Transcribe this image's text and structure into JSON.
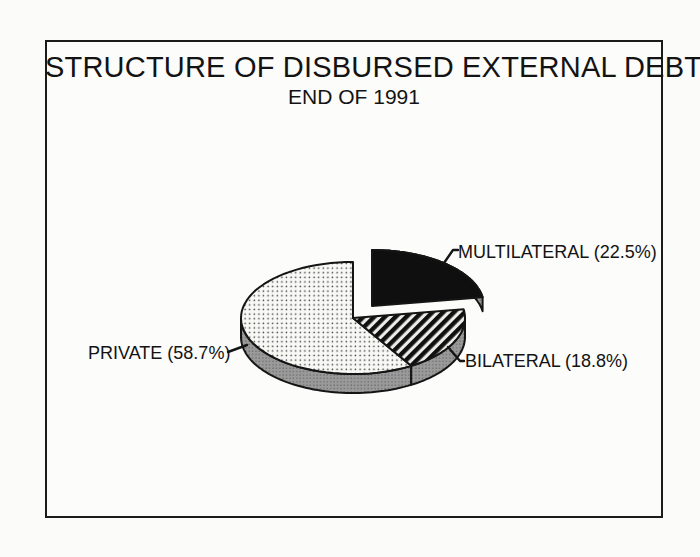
{
  "chart_data": {
    "type": "pie",
    "title": "STRUCTURE OF DISBURSED EXTERNAL DEBT",
    "subtitle": "END OF 1991",
    "unit": "%",
    "start_angle_deg": 90,
    "direction": "clockwise",
    "projection": "3d-ellipse",
    "legend": "none",
    "labels_as_callouts": true,
    "slices": [
      {
        "label": "MULTILATERAL",
        "value": 22.5,
        "display": "MULTILATERAL (22.5%)",
        "fill_style": "solid-black",
        "top_color": "#0f0f0f",
        "exploded": true,
        "label_side": "right"
      },
      {
        "label": "BILATERAL",
        "value": 18.8,
        "display": "BILATERAL (18.8%)",
        "fill_style": "diagonal-hatch",
        "top_color": "#111111",
        "exploded": false,
        "label_side": "right"
      },
      {
        "label": "PRIVATE",
        "value": 58.7,
        "display": "PRIVATE (58.7%)",
        "fill_style": "dot-stipple",
        "top_color": "#f6f6f4",
        "exploded": false,
        "label_side": "left"
      }
    ],
    "style": {
      "side_color": "#989898",
      "outline_color": "#151515",
      "background": "#fcfcfa"
    }
  }
}
